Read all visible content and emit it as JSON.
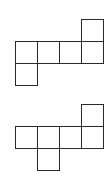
{
  "diagram": {
    "type": "cube-nets",
    "line_color": "#2a2a2a",
    "background": "#ffffff",
    "cell_size_px": 22,
    "figures": [
      {
        "name": "net-1",
        "origin": [
          15,
          19
        ],
        "cells": [
          [
            3,
            0
          ],
          [
            0,
            1
          ],
          [
            1,
            1
          ],
          [
            2,
            1
          ],
          [
            3,
            1
          ],
          [
            0,
            2
          ]
        ]
      },
      {
        "name": "net-2",
        "origin": [
          15,
          104
        ],
        "cells": [
          [
            3,
            0
          ],
          [
            0,
            1
          ],
          [
            1,
            1
          ],
          [
            2,
            1
          ],
          [
            3,
            1
          ],
          [
            1,
            2
          ]
        ]
      }
    ]
  }
}
